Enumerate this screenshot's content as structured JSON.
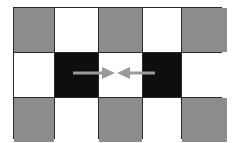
{
  "diagram": {
    "colors": {
      "gray": "#8c8c8c",
      "white": "#ffffff",
      "black": "#0e0e0e",
      "border": "#2a2a2a",
      "arrow": "#9a9a9a"
    },
    "rows": [
      [
        "gray",
        "white",
        "gray",
        "white",
        "gray"
      ],
      [
        "white",
        "black",
        "white",
        "black",
        "white"
      ],
      [
        "gray",
        "white",
        "gray",
        "white",
        "gray"
      ]
    ],
    "arrows": [
      {
        "name": "left-arrow",
        "from_cell": [
          1,
          1
        ],
        "direction": "right",
        "x1": 73,
        "x2": 114,
        "y": 73
      },
      {
        "name": "right-arrow",
        "from_cell": [
          1,
          3
        ],
        "direction": "left",
        "x1": 155,
        "x2": 118,
        "y": 73
      }
    ]
  }
}
